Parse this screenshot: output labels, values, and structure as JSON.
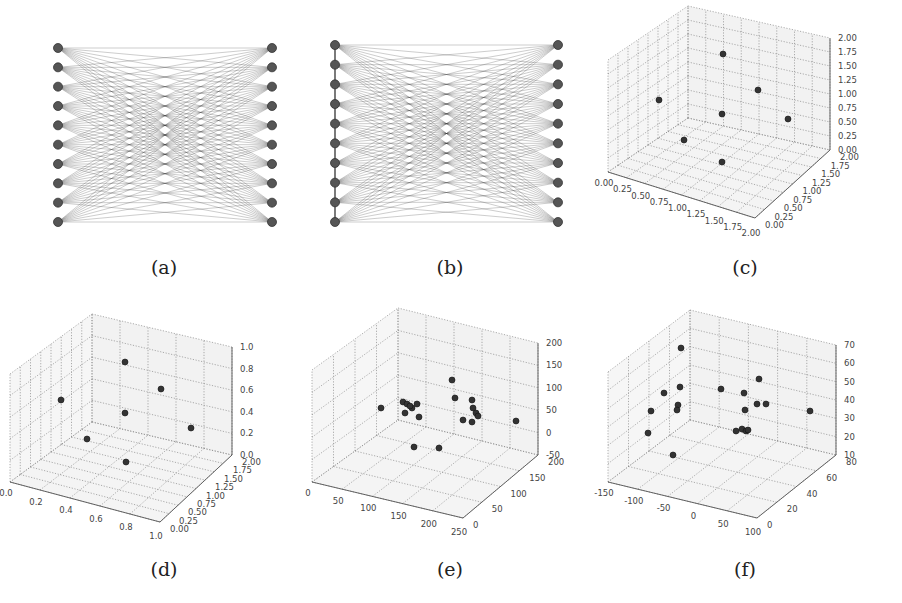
{
  "figure": {
    "captions": [
      "(a)",
      "(b)",
      "(c)",
      "(d)",
      "(e)",
      "(f)"
    ]
  },
  "chart_data": [
    {
      "id": "a",
      "type": "diagram",
      "title": "(a)",
      "description": "Complete bipartite graph K(10,10): 10 nodes in left column, 10 in right column, every left node connected to every right node",
      "left_nodes": 10,
      "right_nodes": 10,
      "left_column_chain": false
    },
    {
      "id": "b",
      "type": "diagram",
      "title": "(b)",
      "description": "Complete bipartite graph K(10,10) with additional edges chaining the left-column nodes vertically",
      "left_nodes": 10,
      "right_nodes": 10,
      "left_column_chain": true
    },
    {
      "id": "c",
      "type": "scatter3d",
      "title": "(c)",
      "xticks": [
        "0.00",
        "0.25",
        "0.50",
        "0.75",
        "1.00",
        "1.25",
        "1.50",
        "1.75",
        "2.00"
      ],
      "yticks": [
        "0.00",
        "0.25",
        "0.50",
        "0.75",
        "1.00",
        "1.25",
        "1.50",
        "1.75",
        "2.00"
      ],
      "zticks": [
        "0.00",
        "0.25",
        "0.50",
        "0.75",
        "1.00",
        "1.25",
        "1.50",
        "1.75",
        "2.00"
      ],
      "xlim": [
        0,
        2
      ],
      "ylim": [
        0,
        2
      ],
      "zlim": [
        0,
        2
      ],
      "grid": true,
      "points": [
        {
          "x": 0,
          "y": 0,
          "z": 2
        },
        {
          "x": 2,
          "y": 0,
          "z": 2
        },
        {
          "x": 0,
          "y": 2,
          "z": 2
        },
        {
          "x": 0,
          "y": 0,
          "z": 1
        },
        {
          "x": 2,
          "y": 2,
          "z": 1
        },
        {
          "x": 0,
          "y": 2,
          "z": 0
        },
        {
          "x": 2,
          "y": 0,
          "z": 0
        }
      ]
    },
    {
      "id": "d",
      "type": "scatter3d",
      "title": "(d)",
      "xticks": [
        "0.0",
        "0.2",
        "0.4",
        "0.6",
        "0.8",
        "1.0"
      ],
      "yticks": [
        "0.00",
        "0.25",
        "0.50",
        "0.75",
        "1.00",
        "1.25",
        "1.50",
        "1.75",
        "2.00"
      ],
      "zticks": [
        "0.0",
        "0.2",
        "0.4",
        "0.6",
        "0.8",
        "1.0"
      ],
      "xlim": [
        0,
        1
      ],
      "ylim": [
        0,
        2
      ],
      "zlim": [
        0,
        1
      ],
      "grid": true,
      "points": [
        {
          "x": 0,
          "y": 0,
          "z": 1
        },
        {
          "x": 1,
          "y": 0,
          "z": 1
        },
        {
          "x": 0,
          "y": 2,
          "z": 1
        },
        {
          "x": 0,
          "y": 0,
          "z": 0.5
        },
        {
          "x": 1,
          "y": 2,
          "z": 0.5
        },
        {
          "x": 0,
          "y": 2,
          "z": 0
        },
        {
          "x": 1,
          "y": 0,
          "z": 0
        }
      ]
    },
    {
      "id": "e",
      "type": "scatter3d",
      "title": "(e)",
      "xticks": [
        "0",
        "50",
        "100",
        "150",
        "200",
        "250"
      ],
      "yticks": [
        "0",
        "50",
        "100",
        "150",
        "200"
      ],
      "zticks": [
        "-50",
        "0",
        "50",
        "100",
        "150",
        "200"
      ],
      "xlim": [
        0,
        250
      ],
      "ylim": [
        0,
        200
      ],
      "zlim": [
        -50,
        200
      ],
      "grid": true,
      "point_count": 19
    },
    {
      "id": "f",
      "type": "scatter3d",
      "title": "(f)",
      "xticks": [
        "-150",
        "-100",
        "-50",
        "0",
        "50",
        "100"
      ],
      "yticks": [
        "0",
        "20",
        "40",
        "60",
        "80"
      ],
      "zticks": [
        "10",
        "20",
        "30",
        "40",
        "50",
        "60",
        "70"
      ],
      "xlim": [
        -150,
        100
      ],
      "ylim": [
        0,
        80
      ],
      "zlim": [
        5,
        75
      ],
      "grid": true,
      "point_count": 19
    }
  ]
}
